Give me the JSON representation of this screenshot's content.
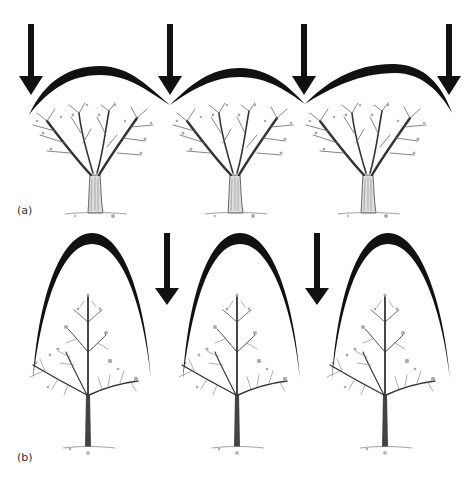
{
  "figure": {
    "panels": [
      {
        "id": "a",
        "label": "(a)",
        "description": "Trees with wide rounded canopies forming a continuous arched canopy line; light arrows striking at canopy junctions",
        "trees": [
          {
            "trunk_x": 95,
            "canopy_peak_x": 95
          },
          {
            "trunk_x": 235,
            "canopy_peak_x": 240
          },
          {
            "trunk_x": 368,
            "canopy_peak_x": 395
          }
        ],
        "arrows": [
          {
            "x": 31,
            "top": 24,
            "bottom": 95
          },
          {
            "x": 170,
            "top": 24,
            "bottom": 95
          },
          {
            "x": 304,
            "top": 24,
            "bottom": 95
          },
          {
            "x": 449,
            "top": 24,
            "bottom": 95
          }
        ]
      },
      {
        "id": "b",
        "label": "(b)",
        "description": "Trees with narrow conical/parabolic canopies and central leader; light arrows reaching between the trees",
        "trees": [
          {
            "trunk_x": 88,
            "canopy_peak_x": 92
          },
          {
            "trunk_x": 237,
            "canopy_peak_x": 240
          },
          {
            "trunk_x": 385,
            "canopy_peak_x": 388
          }
        ],
        "arrows": [
          {
            "x": 167,
            "top": 233,
            "bottom": 305
          },
          {
            "x": 317,
            "top": 233,
            "bottom": 305
          }
        ]
      }
    ],
    "colors": {
      "ink": "#111111",
      "sketch": "#666666",
      "light_sketch": "#9a9a9a",
      "background": "#ffffff"
    }
  }
}
